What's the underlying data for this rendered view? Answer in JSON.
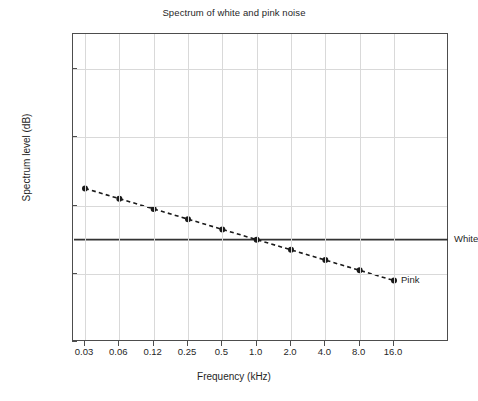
{
  "chart_data": {
    "type": "line",
    "title": "Spectrum of white and pink noise",
    "xlabel": "Frequency (kHz)",
    "ylabel": "Spectrum level (dB)",
    "x_tick_labels": [
      "0.03",
      "0.06",
      "0.12",
      "0.25",
      "0.5",
      "1.0",
      "2.0",
      "4.0",
      "8.0",
      "16.0"
    ],
    "x_values": [
      0.03,
      0.06,
      0.12,
      0.25,
      0.5,
      1.0,
      2.0,
      4.0,
      8.0,
      16.0
    ],
    "x_scale": "log2-octave",
    "y_tick_labels": [
      "0",
      "20",
      "40",
      "60",
      "80"
    ],
    "y_ticks": [
      0,
      20,
      40,
      60,
      80
    ],
    "ylim": [
      0,
      88
    ],
    "grid": true,
    "legend_position": "inline-right-annotation",
    "series": [
      {
        "name": "White",
        "label": "White",
        "style": "solid",
        "markers": false,
        "color": "#333333",
        "values": [
          30,
          30,
          30,
          30,
          30,
          30,
          30,
          30,
          30,
          30
        ]
      },
      {
        "name": "Pink",
        "label": "Pink",
        "style": "dashed",
        "markers": true,
        "color": "#1a1a1a",
        "values": [
          45,
          42,
          39,
          36,
          33,
          30,
          27,
          24,
          21,
          18
        ]
      }
    ],
    "annotations": [
      {
        "text": "White",
        "series": "White"
      },
      {
        "text": "Pink",
        "series": "Pink"
      }
    ]
  },
  "axis": {
    "title": "Spectrum of white and pink noise",
    "xlabel": "Frequency (kHz)",
    "ylabel": "Spectrum level (dB)"
  }
}
